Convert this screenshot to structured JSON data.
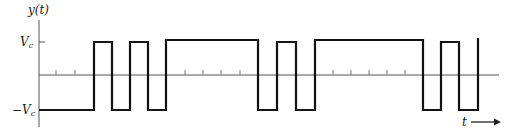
{
  "diagram": {
    "y_axis_label": "y(t)",
    "x_axis_label": "t",
    "level_high_label": "V",
    "level_high_sub": "c",
    "level_low_label": "−V",
    "level_low_sub": "c",
    "colors": {
      "waveform": "#111111",
      "axis": "#555555",
      "text": "#222222"
    },
    "bit_period_px": 18.5,
    "signal_levels": [
      "+Vc",
      "-Vc"
    ],
    "bit_sequence": [
      -1,
      -1,
      -1,
      1,
      -1,
      1,
      -1,
      1,
      1,
      1,
      1,
      1,
      -1,
      1,
      -1,
      1,
      1,
      1,
      1,
      1,
      1,
      -1,
      1,
      -1,
      1
    ],
    "transitions_px": [
      94,
      112,
      130,
      148,
      166,
      258,
      277,
      296,
      315,
      423,
      441,
      459,
      478
    ],
    "tick_marks_px": [
      56,
      75,
      185,
      203,
      221,
      240,
      333,
      351,
      369,
      387,
      405
    ]
  }
}
